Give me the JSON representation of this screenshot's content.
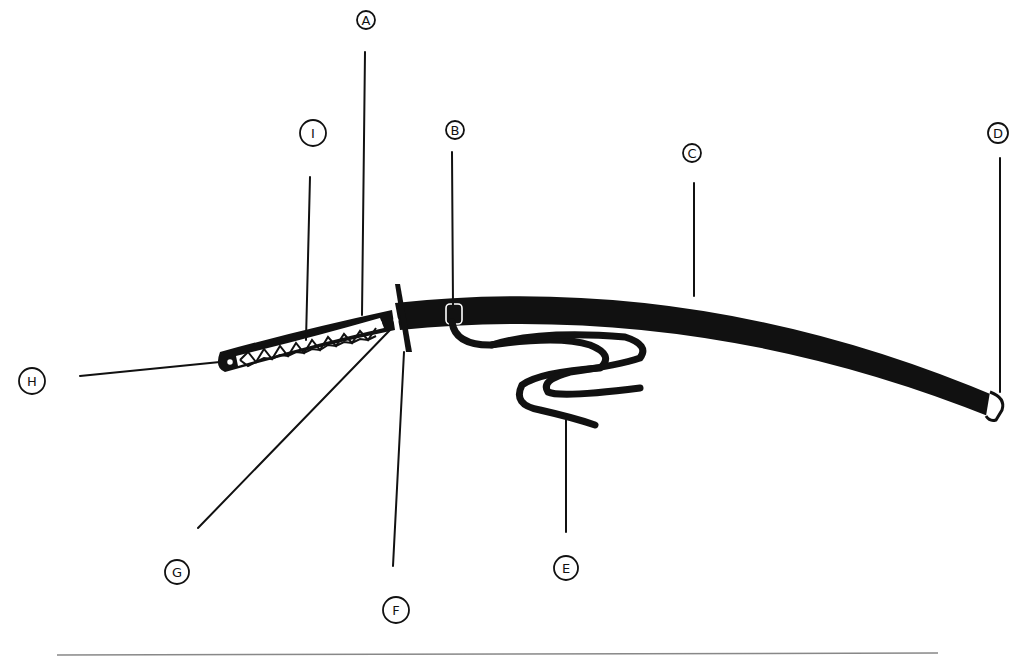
{
  "diagram": {
    "colors": {
      "ink": "#111111",
      "background": "#ffffff",
      "baseline": "#888888"
    },
    "labels": [
      {
        "id": "A",
        "text": "A",
        "x": 366,
        "y": 20,
        "points_to": "tsuka-ito (handle wrap, upper)"
      },
      {
        "id": "B",
        "text": "B",
        "x": 455,
        "y": 130,
        "points_to": "kurikata (cord knob)"
      },
      {
        "id": "C",
        "text": "C",
        "x": 692,
        "y": 153,
        "points_to": "saya (scabbard)"
      },
      {
        "id": "D",
        "text": "D",
        "x": 998,
        "y": 133,
        "points_to": "kojiri (scabbard end cap)"
      },
      {
        "id": "E",
        "text": "E",
        "x": 566,
        "y": 568,
        "points_to": "sageo (cord)"
      },
      {
        "id": "F",
        "text": "F",
        "x": 396,
        "y": 610,
        "points_to": "tsuba (guard)"
      },
      {
        "id": "G",
        "text": "G",
        "x": 177,
        "y": 572,
        "points_to": "habaki / fuchi"
      },
      {
        "id": "H",
        "text": "H",
        "x": 32,
        "y": 381,
        "points_to": "kashira (pommel)"
      },
      {
        "id": "I",
        "text": "I",
        "x": 313,
        "y": 133,
        "points_to": "tsuka (handle)"
      }
    ]
  }
}
